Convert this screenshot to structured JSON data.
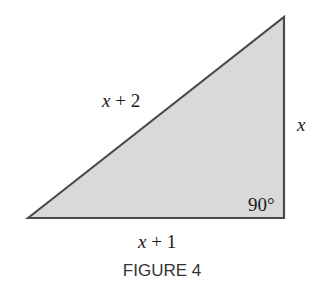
{
  "figure": {
    "caption": "FIGURE 4",
    "fill_color": "#d9d9d9",
    "stroke_color": "#4a4a4a",
    "hypotenuse_label": {
      "var": "x",
      "rest": " + 2"
    },
    "vertical_label": {
      "var": "x"
    },
    "base_label": {
      "var": "x",
      "rest": " + 1"
    },
    "angle_label": "90°"
  }
}
